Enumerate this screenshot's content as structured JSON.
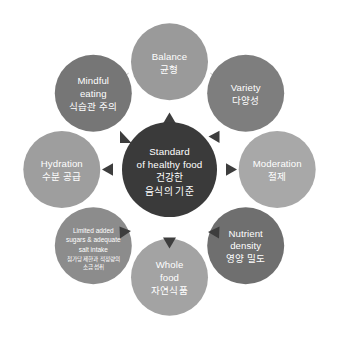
{
  "diagram": {
    "type": "radial-cycle",
    "center": {
      "name": "standard-of-healthy-food",
      "lines_en": [
        "Standard",
        "of healthy food"
      ],
      "lines_ko": [
        "건강한",
        "음식의 기준"
      ],
      "color": "#3a3a3a",
      "text_color": "#ffffff"
    },
    "nodes": [
      {
        "id": "balance",
        "position": "top",
        "lines_en": [
          "Balance"
        ],
        "lines_ko": [
          "균형"
        ],
        "color": "#9a9a9a"
      },
      {
        "id": "variety",
        "position": "top-right",
        "lines_en": [
          "Variety"
        ],
        "lines_ko": [
          "다양성"
        ],
        "color": "#7e7e7e"
      },
      {
        "id": "moderation",
        "position": "right",
        "lines_en": [
          "Moderation"
        ],
        "lines_ko": [
          "절제"
        ],
        "color": "#a8a8a8"
      },
      {
        "id": "nutrient-density",
        "position": "bottom-right",
        "lines_en": [
          "Nutrient",
          "density"
        ],
        "lines_ko": [
          "영양 밀도"
        ],
        "color": "#6f6f6f"
      },
      {
        "id": "whole-food",
        "position": "bottom",
        "lines_en": [
          "Whole",
          "food"
        ],
        "lines_ko": [
          "자연식품"
        ],
        "color": "#a3a3a3"
      },
      {
        "id": "limited-added-sugars",
        "position": "bottom-left",
        "lines_en": [
          "Limited added",
          "sugars & adequate",
          "salt intake"
        ],
        "lines_ko": [
          "첨가당 제한과 적정량의",
          "소금 섭취"
        ],
        "color": "#8c8c8c"
      },
      {
        "id": "hydration",
        "position": "left",
        "lines_en": [
          "Hydration"
        ],
        "lines_ko": [
          "수분 공급"
        ],
        "color": "#9e9e9e"
      },
      {
        "id": "mindful-eating",
        "position": "top-left",
        "lines_en": [
          "Mindful",
          "eating"
        ],
        "lines_ko": [
          "식습관 주의"
        ],
        "color": "#767676"
      }
    ],
    "arrows": [
      {
        "id": "arrow-up",
        "direction": "up"
      },
      {
        "id": "arrow-upper-right",
        "direction": "left"
      },
      {
        "id": "arrow-right",
        "direction": "right"
      },
      {
        "id": "arrow-lower-right",
        "direction": "down-left"
      },
      {
        "id": "arrow-down",
        "direction": "down"
      },
      {
        "id": "arrow-lower-left",
        "direction": "up-right"
      },
      {
        "id": "arrow-left",
        "direction": "left"
      },
      {
        "id": "arrow-upper-left",
        "direction": "down-right"
      }
    ],
    "connector_color": "#9b9b9b",
    "background_color": "#ffffff"
  }
}
